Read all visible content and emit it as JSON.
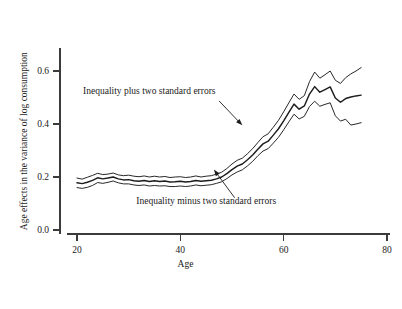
{
  "chart_data": {
    "type": "line",
    "title": "",
    "subtitle": "",
    "xlabel": "Age",
    "ylabel": "Age effects in the variance of log consumption",
    "xlim": [
      18,
      80
    ],
    "ylim": [
      -0.02,
      0.68
    ],
    "xticks": [
      20,
      40,
      60,
      80
    ],
    "xtick_labels": [
      "20",
      "40",
      "60",
      "80"
    ],
    "yticks": [
      0.0,
      0.2,
      0.4,
      0.6
    ],
    "ytick_labels": [
      "0.0",
      "0.2",
      "0.4",
      "0.6"
    ],
    "grid": false,
    "legend_position": "none",
    "annotations": [
      {
        "name": "upper-band-annotation",
        "text": "Inequality plus two standard errors",
        "text_x": 34,
        "text_y": 0.515,
        "arrow_from_x": 47.5,
        "arrow_from_y": 0.487,
        "arrow_to_x": 52.0,
        "arrow_to_y": 0.395
      },
      {
        "name": "lower-band-annotation",
        "text": "Inequality minus two standard errors",
        "text_x": 45,
        "text_y": 0.0975,
        "arrow_from_x": 50.5,
        "arrow_from_y": 0.122,
        "arrow_to_x": 46.5,
        "arrow_to_y": 0.228
      }
    ],
    "x": [
      20,
      21,
      22,
      23,
      24,
      25,
      26,
      27,
      28,
      29,
      30,
      31,
      32,
      33,
      34,
      35,
      36,
      37,
      38,
      39,
      40,
      41,
      42,
      43,
      44,
      45,
      46,
      47,
      48,
      49,
      50,
      51,
      52,
      53,
      54,
      55,
      56,
      57,
      58,
      59,
      60,
      61,
      62,
      63,
      64,
      65,
      66,
      67,
      68,
      69,
      70,
      71,
      72,
      73,
      74,
      75
    ],
    "series": [
      {
        "name": "Inequality plus two standard errors",
        "values": [
          0.196,
          0.192,
          0.199,
          0.206,
          0.214,
          0.209,
          0.211,
          0.215,
          0.208,
          0.205,
          0.207,
          0.203,
          0.201,
          0.204,
          0.2,
          0.203,
          0.2,
          0.202,
          0.198,
          0.2,
          0.201,
          0.198,
          0.2,
          0.204,
          0.2,
          0.203,
          0.205,
          0.211,
          0.218,
          0.232,
          0.249,
          0.263,
          0.271,
          0.288,
          0.307,
          0.33,
          0.352,
          0.363,
          0.388,
          0.414,
          0.446,
          0.48,
          0.513,
          0.493,
          0.507,
          0.56,
          0.596,
          0.573,
          0.586,
          0.6,
          0.565,
          0.553,
          0.575,
          0.589,
          0.6,
          0.613
        ]
      },
      {
        "name": "Inequality",
        "values": [
          0.178,
          0.175,
          0.18,
          0.187,
          0.197,
          0.193,
          0.196,
          0.2,
          0.193,
          0.189,
          0.19,
          0.186,
          0.184,
          0.187,
          0.183,
          0.186,
          0.183,
          0.185,
          0.181,
          0.182,
          0.184,
          0.181,
          0.183,
          0.187,
          0.184,
          0.186,
          0.188,
          0.193,
          0.2,
          0.213,
          0.228,
          0.241,
          0.249,
          0.265,
          0.283,
          0.305,
          0.325,
          0.335,
          0.358,
          0.382,
          0.412,
          0.444,
          0.475,
          0.456,
          0.468,
          0.513,
          0.541,
          0.52,
          0.53,
          0.54,
          0.498,
          0.482,
          0.496,
          0.502,
          0.506,
          0.509
        ]
      },
      {
        "name": "Inequality minus two standard errors",
        "values": [
          0.16,
          0.157,
          0.161,
          0.168,
          0.179,
          0.176,
          0.18,
          0.185,
          0.178,
          0.174,
          0.174,
          0.17,
          0.168,
          0.17,
          0.166,
          0.168,
          0.166,
          0.167,
          0.164,
          0.164,
          0.166,
          0.164,
          0.166,
          0.17,
          0.167,
          0.169,
          0.171,
          0.176,
          0.182,
          0.194,
          0.208,
          0.219,
          0.227,
          0.242,
          0.259,
          0.28,
          0.298,
          0.307,
          0.328,
          0.35,
          0.378,
          0.408,
          0.437,
          0.419,
          0.429,
          0.466,
          0.486,
          0.467,
          0.474,
          0.48,
          0.431,
          0.411,
          0.418,
          0.396,
          0.4,
          0.405
        ]
      }
    ]
  },
  "colors": {
    "line": "#1c1c1c",
    "axis": "#3b3b3b",
    "background": "#ffffff"
  }
}
